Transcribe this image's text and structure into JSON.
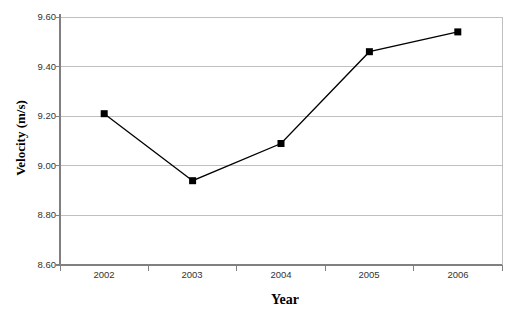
{
  "chart_data": {
    "type": "line",
    "title": "",
    "xlabel": "Year",
    "ylabel": "Velocity (m/s)",
    "categories": [
      "2002",
      "2003",
      "2004",
      "2005",
      "2006"
    ],
    "values": [
      9.21,
      8.94,
      9.09,
      9.46,
      9.54
    ],
    "series": [
      {
        "name": "Velocity",
        "values": [
          9.21,
          8.94,
          9.09,
          9.46,
          9.54
        ]
      }
    ],
    "ylim": [
      8.6,
      9.6
    ],
    "ytick_labels": [
      "9.60",
      "9.40",
      "9.20",
      "9.00",
      "8.80",
      "8.60"
    ],
    "ytick_values": [
      9.6,
      9.4,
      9.2,
      9.0,
      8.8,
      8.6
    ],
    "grid": "horizontal",
    "legend": "none",
    "marker": "square",
    "marker_color": "#000000",
    "line_color": "#000000"
  },
  "axis": {
    "y_title": "Velocity (m/s)",
    "x_title": "Year"
  }
}
